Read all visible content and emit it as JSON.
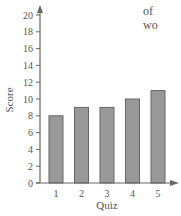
{
  "chart_data": {
    "type": "bar",
    "title": "",
    "xlabel": "Quiz",
    "ylabel": "Score",
    "categories": [
      "1",
      "2",
      "3",
      "4",
      "5"
    ],
    "values": [
      8,
      9,
      9,
      10,
      11
    ],
    "ylim": [
      0,
      20
    ],
    "yticks": [
      0,
      2,
      4,
      6,
      8,
      10,
      12,
      14,
      16,
      18,
      20
    ],
    "grid": false,
    "legend": null,
    "bar_color": "#999999",
    "bar_edge_color": "#666666",
    "axis_color": "#666666"
  },
  "side_text": {
    "line1": "of",
    "line2": "wo"
  }
}
